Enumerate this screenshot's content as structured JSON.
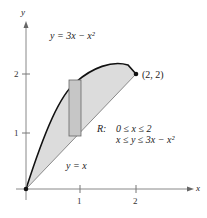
{
  "figure": {
    "axis_x_label": "x",
    "axis_y_label": "y",
    "x_ticks": [
      "1",
      "2"
    ],
    "y_ticks": [
      "1",
      "2"
    ],
    "curve_upper_label": "y = 3x − x²",
    "curve_lower_label": "y = x",
    "point_label": "(2, 2)",
    "region_label": "R:",
    "region_line1": "0 ≤ x ≤ 2",
    "region_line2": "x ≤ y ≤ 3x − x²",
    "colors": {
      "region_fill": "#d9d9d9",
      "rect_fill": "#c8c8c8",
      "curve": "#111111",
      "line": "#888888"
    }
  }
}
